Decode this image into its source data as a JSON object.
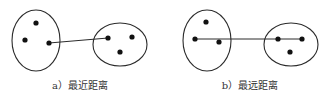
{
  "figure": {
    "colors": {
      "stroke": "#2b2b2b",
      "point": "#111111",
      "background": "#ffffff"
    },
    "panels": [
      {
        "id": "a",
        "caption": "a）最近距离",
        "caption_x": 80,
        "clusters": [
          {
            "cx": 36,
            "cy": 40.5,
            "rx": 24,
            "ry": 30.5,
            "points": [
              [
                36,
                23
              ],
              [
                25,
                40
              ],
              [
                49,
                43
              ]
            ]
          },
          {
            "cx": 120,
            "cy": 44.5,
            "rx": 27,
            "ry": 21.5,
            "points": [
              [
                108,
                38
              ],
              [
                132,
                37
              ],
              [
                120,
                52
              ]
            ]
          }
        ],
        "link": {
          "x1": 49,
          "y1": 43,
          "x2": 108,
          "y2": 38,
          "meaning": "minimum distance between clusters"
        }
      },
      {
        "id": "b",
        "caption": "b）最远距离",
        "caption_x": 250,
        "clusters": [
          {
            "cx": 207,
            "cy": 40.5,
            "rx": 24,
            "ry": 30.5,
            "points": [
              [
                206,
                22
              ],
              [
                195,
                39
              ],
              [
                219,
                42
              ]
            ]
          },
          {
            "cx": 291,
            "cy": 44.5,
            "rx": 27,
            "ry": 21.5,
            "points": [
              [
                278,
                39
              ],
              [
                302,
                39
              ],
              [
                290,
                52
              ]
            ]
          }
        ],
        "link": {
          "x1": 195,
          "y1": 39,
          "x2": 302,
          "y2": 39,
          "meaning": "maximum distance between clusters"
        }
      }
    ]
  }
}
